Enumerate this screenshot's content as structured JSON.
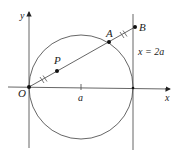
{
  "diagram": {
    "type": "geometry",
    "labels": {
      "y_axis": "y",
      "x_axis": "x",
      "origin": "O",
      "tick_a": "a",
      "point_P": "P",
      "point_A": "A",
      "point_B": "B",
      "tangent_line": "x = 2a"
    },
    "points": {
      "O": {
        "x": 29,
        "y": 87
      },
      "P": {
        "x": 57,
        "y": 70
      },
      "A": {
        "x": 109,
        "y": 42
      },
      "B": {
        "x": 135,
        "y": 27
      }
    },
    "circle": {
      "cx": 81,
      "cy": 87,
      "r": 52
    },
    "colors": {
      "stroke": "#444444",
      "point": "#111111",
      "background": "#ffffff"
    }
  }
}
